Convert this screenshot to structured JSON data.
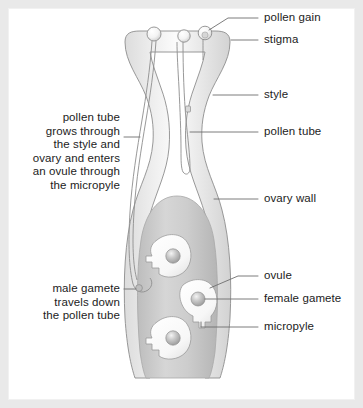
{
  "diagram": {
    "background_color": "#e9e9e9",
    "panel_color": "#ffffff",
    "outline_color": "#8d8d8d",
    "leader_color": "#6e6e6e",
    "text_color": "#1c1c1c",
    "pistil_fill_light": "#f2f2f2",
    "pistil_fill_mid": "#e2e2e2",
    "ovary_cavity_fill": "#c9c9c9",
    "ovule_fill": "#fafafa",
    "gamete_fill": "#b9b9b9"
  },
  "labels": {
    "pollen_grain": "pollen gain",
    "stigma": "stigma",
    "style": "style",
    "pollen_tube": "pollen tube",
    "ovary_wall": "ovary wall",
    "ovule": "ovule",
    "female_gamete": "female gamete",
    "micropyle": "micropyle",
    "pollen_tube_note": "pollen tube\ngrows through\nthe style and\novary and enters\nan ovule through\nthe micropyle",
    "male_gamete_note": "male gamete\ntravels down\nthe pollen tube"
  },
  "structures": {
    "pollen_grains": 3,
    "pollen_tubes": 3,
    "ovules": 3,
    "female_gametes": 3
  }
}
